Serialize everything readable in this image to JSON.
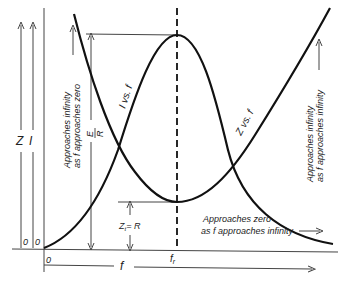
{
  "diagram": {
    "type": "series-resonance-curves",
    "labels": {
      "z_axis": "Z",
      "i_axis": "I",
      "z_origin": "0",
      "i_origin": "0",
      "f_origin": "0",
      "f_axis": "f",
      "f_resonance": "f",
      "f_resonance_sub": "r",
      "i_curve": "I vs. f",
      "z_curve": "Z vs. f",
      "e_over_r_num": "E",
      "e_over_r_den": "R",
      "zt_eq_r": "Z",
      "zt_sub": "t",
      "zt_rest": "= R",
      "left_note_line1": "Approaches infinity",
      "left_note_line2": "as f approaches zero",
      "right_note_line1": "Approaches infinity",
      "right_note_line2": "as f approaches infinity",
      "bottom_note_line1": "Approaches zero",
      "bottom_note_line2": "as f approaches infinity"
    },
    "colors": {
      "line": "#111111",
      "thin_line": "#444444",
      "background": "#ffffff"
    }
  }
}
